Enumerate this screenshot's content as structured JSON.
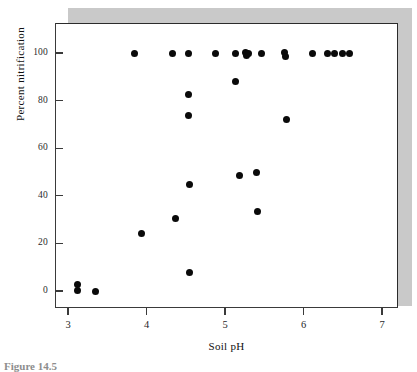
{
  "figure": {
    "caption": "Figure 14.5",
    "background_color": "#ffffff",
    "shadow_color": "#c9c9c9",
    "marker_color": "#0a0a0a",
    "frame_color": "#2b2b2b"
  },
  "chart_data": {
    "type": "scatter",
    "title": "",
    "xlabel": "Soil pH",
    "ylabel": "Percent nitrification",
    "xlim": [
      2.83,
      7.2
    ],
    "ylim": [
      -5,
      108
    ],
    "xticks": [
      3,
      4,
      5,
      6,
      7
    ],
    "xtick_labels": [
      "3",
      "4",
      "5",
      "6",
      "7"
    ],
    "yticks": [
      0,
      20,
      40,
      60,
      80,
      100
    ],
    "ytick_labels": [
      "0",
      "20",
      "40",
      "60",
      "80",
      "100"
    ],
    "grid": false,
    "legend": null,
    "marker": "filled-circle",
    "n_points": 34,
    "points": [
      {
        "x": 3.12,
        "y": 2.9
      },
      {
        "x": 3.12,
        "y": 0.2
      },
      {
        "x": 3.35,
        "y": 0.0
      },
      {
        "x": 3.85,
        "y": 100.0
      },
      {
        "x": 3.93,
        "y": 24.1
      },
      {
        "x": 4.33,
        "y": 100.0
      },
      {
        "x": 4.37,
        "y": 30.3
      },
      {
        "x": 4.53,
        "y": 100.0
      },
      {
        "x": 4.54,
        "y": 82.6
      },
      {
        "x": 4.54,
        "y": 73.6
      },
      {
        "x": 4.55,
        "y": 44.8
      },
      {
        "x": 4.55,
        "y": 7.7
      },
      {
        "x": 4.88,
        "y": 100.0
      },
      {
        "x": 5.13,
        "y": 100.0
      },
      {
        "x": 5.14,
        "y": 88.0
      },
      {
        "x": 5.19,
        "y": 48.5
      },
      {
        "x": 5.26,
        "y": 100.3
      },
      {
        "x": 5.27,
        "y": 98.8
      },
      {
        "x": 5.3,
        "y": 100.0
      },
      {
        "x": 5.4,
        "y": 49.8
      },
      {
        "x": 5.41,
        "y": 33.6
      },
      {
        "x": 5.47,
        "y": 100.0
      },
      {
        "x": 5.76,
        "y": 100.4
      },
      {
        "x": 5.77,
        "y": 98.6
      },
      {
        "x": 5.78,
        "y": 71.9
      },
      {
        "x": 6.12,
        "y": 100.0
      },
      {
        "x": 6.31,
        "y": 100.0
      },
      {
        "x": 6.4,
        "y": 100.0
      },
      {
        "x": 6.5,
        "y": 100.0
      },
      {
        "x": 6.58,
        "y": 100.0
      }
    ]
  }
}
